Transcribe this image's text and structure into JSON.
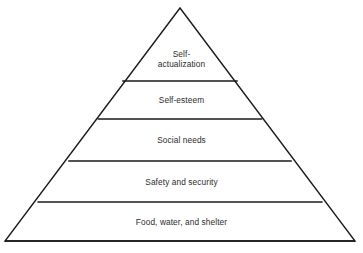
{
  "diagram": {
    "name": "Maslow's hierarchy of needs pyramid",
    "shape": "pyramid",
    "background_color": "#ffffff",
    "stroke_color": "#1a1a1a",
    "text_color": "#2b2b2b",
    "geometry": {
      "apex": [
        180,
        8
      ],
      "base_left": [
        5,
        241
      ],
      "base_right": [
        355,
        241
      ],
      "divider_y": [
        81,
        119,
        161,
        202
      ]
    },
    "tiers": [
      {
        "id": "tier-self-actualization",
        "label": "Self-\nactualization",
        "label_text": "Self-actualization",
        "level": 5,
        "label_center_y": 59
      },
      {
        "id": "tier-self-esteem",
        "label": "Self-esteem",
        "label_text": "Self-esteem",
        "level": 4,
        "label_center_y": 100
      },
      {
        "id": "tier-social-needs",
        "label": "Social needs",
        "label_text": "Social needs",
        "level": 3,
        "label_center_y": 140
      },
      {
        "id": "tier-safety-and-security",
        "label": "Safety and security",
        "label_text": "Safety and security",
        "level": 2,
        "label_center_y": 182
      },
      {
        "id": "tier-food-water-and-shelter",
        "label": "Food, water, and shelter",
        "label_text": "Food, water, and shelter",
        "level": 1,
        "label_center_y": 222
      }
    ]
  }
}
